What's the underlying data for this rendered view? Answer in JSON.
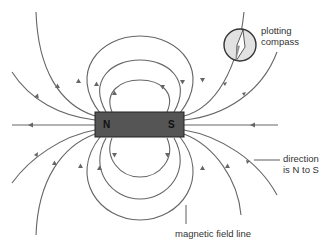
{
  "diagram": {
    "magnet": {
      "north_label": "N",
      "south_label": "S",
      "fill": "#555555"
    },
    "labels": {
      "compass_line1": "plotting",
      "compass_line2": "compass",
      "direction_line1": "direction",
      "direction_line2": "is N to S",
      "field_line": "magnetic field line"
    },
    "colors": {
      "field_line": "#666666",
      "compass_fill": "#e2e2e2",
      "compass_stroke": "#333333",
      "text": "#333333"
    }
  }
}
